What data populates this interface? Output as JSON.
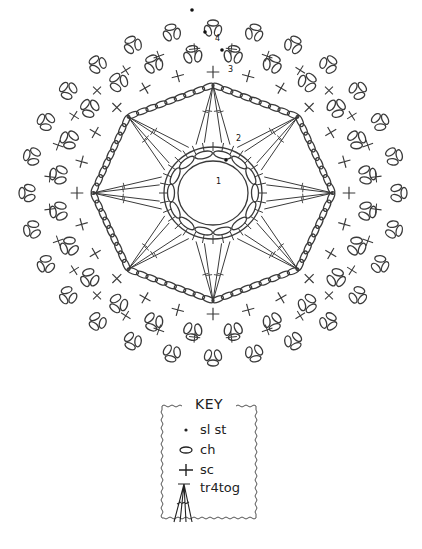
{
  "diagram": {
    "center": [
      213,
      193
    ],
    "colors": {
      "stroke": "#3a3a3a",
      "background": "#ffffff"
    },
    "round_labels": [
      {
        "label": "1",
        "x": 216,
        "y": 184
      },
      {
        "label": "2",
        "x": 236,
        "y": 141
      },
      {
        "label": "3",
        "x": 228,
        "y": 72
      },
      {
        "label": "4",
        "x": 215,
        "y": 41
      }
    ],
    "rounds": {
      "round1": {
        "name": "ring of chains",
        "rx": 43,
        "ry": 40,
        "chains": 14
      },
      "round2": {
        "name": "tr4tog points",
        "points": 8
      },
      "octagon": {
        "name": "chain arcs",
        "rx": 120,
        "ry": 108
      },
      "round3": {
        "name": "sc with picots",
        "rx": 140,
        "ry": 125,
        "repeats": 24
      },
      "round4": {
        "name": "outer sc with picots",
        "rx": 184,
        "ry": 163,
        "repeats": 28
      }
    }
  },
  "key": {
    "title": "KEY",
    "items": [
      {
        "symbol": "dot-icon",
        "label": "sl st"
      },
      {
        "symbol": "oval-icon",
        "label": "ch"
      },
      {
        "symbol": "plus-icon",
        "label": "sc"
      },
      {
        "symbol": "cluster-icon",
        "label": "tr4tog"
      }
    ]
  }
}
